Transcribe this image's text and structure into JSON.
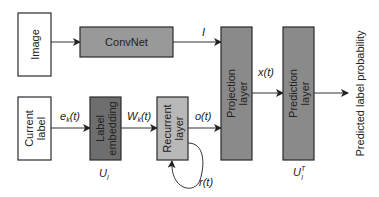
{
  "diagram": {
    "nodes": {
      "image": {
        "label": "Image",
        "fill": "#ffffff"
      },
      "convnet": {
        "label": "ConvNet",
        "fill": "#999999"
      },
      "current_label": {
        "line1": "Current",
        "line2": "label",
        "fill": "#ffffff"
      },
      "label_embedding": {
        "line1": "Label",
        "line2": "embedding",
        "fill": "#6e6e6e"
      },
      "recurrent_layer": {
        "line1": "Recurrent",
        "line2": "layer",
        "fill": "#b8b8b8"
      },
      "projection_layer": {
        "line1": "Projection",
        "line2": "layer",
        "fill": "#8a8a8a"
      },
      "prediction_layer": {
        "line1": "Prediction",
        "line2": "layer",
        "fill": "#8a8a8a"
      }
    },
    "edges": {
      "convnet_out": {
        "label": "I"
      },
      "ek": {
        "main": "e",
        "sub": "k",
        "suffix": "(t)"
      },
      "wk": {
        "main": "W",
        "sub": "k",
        "suffix": "(t)"
      },
      "ot": {
        "label": "o(t)"
      },
      "rt": {
        "label": "r(t)"
      },
      "xt": {
        "label": "x(t)"
      }
    },
    "matrices": {
      "ul": {
        "main": "U",
        "sub": "l"
      },
      "ult": {
        "main": "U",
        "sub": "l",
        "sup": "T"
      }
    },
    "output": {
      "label": "Predicted label probability"
    }
  }
}
